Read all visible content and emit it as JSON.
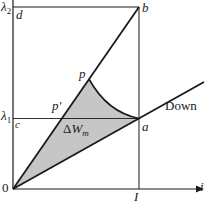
{
  "diagram": {
    "colors": {
      "background": "#ffffff",
      "ink": "#1a1a1a",
      "shade": "#c6c6c6"
    },
    "labels": {
      "lambda2": {
        "base": "λ",
        "sub": "2"
      },
      "d": "d",
      "b": "b",
      "p": "p",
      "p_prime": "p′",
      "lambda1": {
        "base": "λ",
        "sub": "1"
      },
      "c": "c",
      "a": "a",
      "delta_wm": {
        "delta": "Δ",
        "base": "W",
        "sub": "m"
      },
      "down": "Down",
      "origin": "0",
      "current_I": "I",
      "axis_i": "i"
    }
  }
}
